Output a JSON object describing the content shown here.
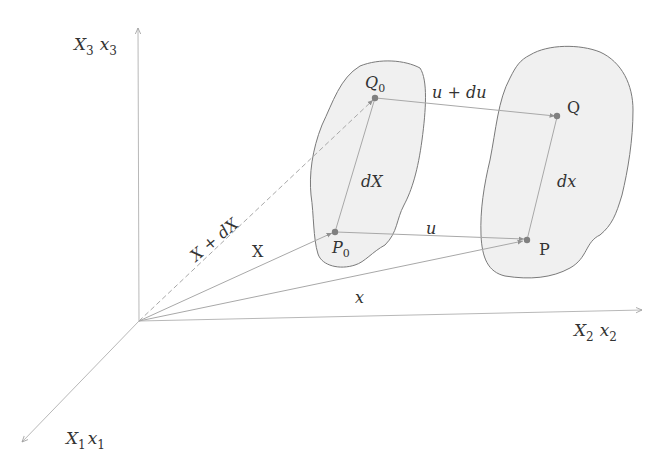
{
  "diagram": {
    "colors": {
      "axis": "#b8b8b8",
      "vector": "#a8a8a8",
      "body_fill": "#f0f0f0",
      "body_stroke": "#7a7a7a",
      "point": "#808080",
      "text": "#333333"
    },
    "axes": {
      "x3": {
        "label_main": "X",
        "sub_main": "3",
        "label_alt": "x",
        "sub_alt": "3"
      },
      "x2": {
        "label_main": "X",
        "sub_main": "2",
        "label_alt": "x",
        "sub_alt": "2"
      },
      "x1": {
        "label_main": "X",
        "sub_main": "1",
        "label_alt": "x",
        "sub_alt": "1"
      }
    },
    "points": {
      "P0": {
        "label": "P",
        "sub": "0"
      },
      "Q0": {
        "label": "Q",
        "sub": "0"
      },
      "P": {
        "label": "P"
      },
      "Q": {
        "label": "Q"
      }
    },
    "vectors": {
      "X": "X",
      "X_plus_dX": "X + dX",
      "x": "x",
      "u": "u",
      "u_plus_du": "u + du",
      "dX": "dX",
      "dx": "dx"
    },
    "bodies": [
      {
        "name": "reference-configuration"
      },
      {
        "name": "current-configuration"
      }
    ]
  }
}
